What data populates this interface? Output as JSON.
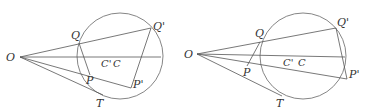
{
  "figures": [
    {
      "name": "left",
      "labels": {
        "O": "O",
        "Q": "Q",
        "Q_prime": "Q'",
        "C_prime": "C'",
        "C": "C",
        "P": "P",
        "P_prime": "P'",
        "T": "T"
      },
      "points": {
        "O": [
          20,
          57
        ],
        "circle_center": [
          120,
          56
        ],
        "circle_radius": 43,
        "Q": [
          79,
          43
        ],
        "Q_prime": [
          151,
          28
        ],
        "P": [
          90,
          75
        ],
        "P_prime": [
          131,
          88
        ],
        "T": [
          103,
          94
        ],
        "axis_end": [
          161,
          57
        ]
      }
    },
    {
      "name": "right",
      "labels": {
        "O": "O",
        "Q": "Q",
        "Q_prime": "Q'",
        "C_prime": "C'",
        "C": "C",
        "P": "P",
        "P_prime": "P'",
        "T": "T"
      },
      "points": {
        "O": [
          197,
          54
        ],
        "circle_center": [
          303,
          56
        ],
        "circle_radius": 43,
        "Q": [
          260,
          42
        ],
        "Q_prime": [
          336,
          28
        ],
        "P": [
          247,
          66
        ],
        "P_prime": [
          347,
          79
        ],
        "T": [
          282,
          95
        ],
        "axis_end": [
          345,
          57
        ]
      }
    }
  ]
}
